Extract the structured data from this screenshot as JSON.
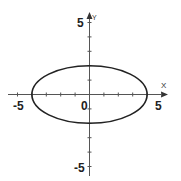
{
  "diagram": {
    "type": "ellipse-on-coordinate-plane",
    "axes": {
      "x_label": "X",
      "y_label": "Y",
      "x_range": [
        -5,
        5
      ],
      "y_range": [
        -5,
        5
      ],
      "tick_labels": {
        "x_min": "-5",
        "x_max": "5",
        "y_min": "-5",
        "y_max": "5",
        "origin": "0"
      }
    },
    "ellipse": {
      "center": [
        0,
        0
      ],
      "semi_major_x": 4,
      "semi_minor_y": 2,
      "color": "#222222"
    },
    "colors": {
      "axis": "#555555",
      "background": "#ffffff"
    }
  }
}
